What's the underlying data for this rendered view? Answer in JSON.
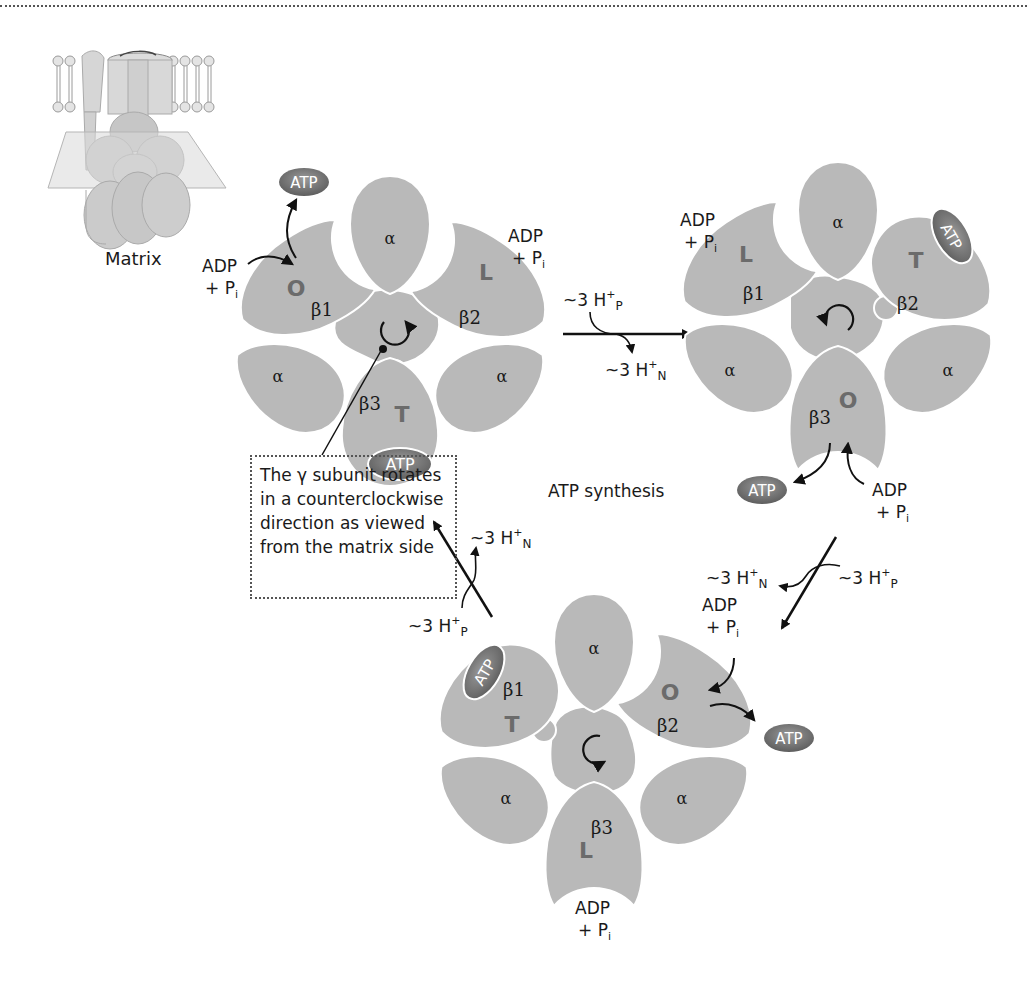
{
  "figure": {
    "title": "ATP synthesis",
    "inset_label": "Matrix",
    "callout_lines": [
      "The γ subunit rotates",
      "in a counterclockwise",
      "direction as viewed",
      "from the matrix side"
    ],
    "colors": {
      "subunit_fill": "#b9b9b9",
      "atp_fill": "#7a7a7a",
      "state_letter": "#6b6b6b",
      "arrow": "#111111"
    }
  },
  "labels": {
    "alpha": "α",
    "atp": "ATP",
    "adp": "ADP",
    "plus_pi": "+ P",
    "pi_sub": "i",
    "proton_p": "~3 H",
    "proton_sup": "+",
    "sub_p": "P",
    "sub_n": "N"
  },
  "states": [
    {
      "id": "state-1",
      "beta": [
        {
          "name": "β1",
          "state": "O"
        },
        {
          "name": "β2",
          "state": "L"
        },
        {
          "name": "β3",
          "state": "T"
        }
      ],
      "rotation": "counterclockwise"
    },
    {
      "id": "state-2",
      "beta": [
        {
          "name": "β1",
          "state": "L"
        },
        {
          "name": "β2",
          "state": "T"
        },
        {
          "name": "β3",
          "state": "O"
        }
      ],
      "rotation": "counterclockwise"
    },
    {
      "id": "state-3",
      "beta": [
        {
          "name": "β1",
          "state": "T"
        },
        {
          "name": "β2",
          "state": "O"
        },
        {
          "name": "β3",
          "state": "L"
        }
      ],
      "rotation": "counterclockwise"
    }
  ],
  "transitions": [
    {
      "from": "state-1",
      "to": "state-2",
      "in": "~3 H+P",
      "out": "~3 H+N"
    },
    {
      "from": "state-2",
      "to": "state-3",
      "in": "~3 H+P",
      "out": "~3 H+N"
    },
    {
      "from": "state-3",
      "to": "state-1",
      "in": "~3 H+P",
      "out": "~3 H+N"
    }
  ]
}
